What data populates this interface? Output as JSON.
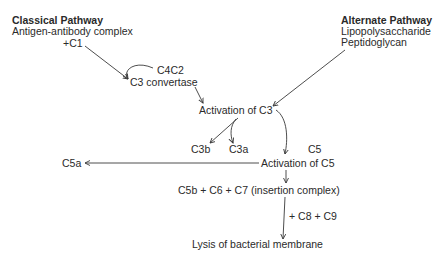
{
  "diagram": {
    "type": "complement-activation-pathway",
    "classical": {
      "title": "Classical Pathway",
      "trigger": "Antigen-antibody complex",
      "plus_c1": "+C1"
    },
    "alternate": {
      "title": "Alternate Pathway",
      "trigger1": "Lipopolysaccharide",
      "trigger2": "Peptidoglycan"
    },
    "nodes": {
      "c4c2": "C4C2",
      "c3_convertase": "C3 convertase",
      "activation_c3": "Activation of C3",
      "c3b": "C3b",
      "c3a": "C3a",
      "c5": "C5",
      "c5a": "C5a",
      "activation_c5": "Activation of C5",
      "insertion_complex": "C5b + C6 + C7 (insertion complex)",
      "plus_c8_c9": "+ C8 + C9",
      "lysis": "Lysis of bacterial membrane"
    },
    "edges": [
      {
        "from": "+C1",
        "to": "C3 convertase"
      },
      {
        "from": "C4C2",
        "to": "C3 convertase"
      },
      {
        "from": "C3 convertase",
        "to": "Activation of C3"
      },
      {
        "from": "Peptidoglycan",
        "to": "Activation of C3"
      },
      {
        "from": "Activation of C3",
        "to": "C3b"
      },
      {
        "from": "Activation of C3",
        "to": "C3a"
      },
      {
        "from": "Activation of C3",
        "to": "Activation of C5"
      },
      {
        "from": "Activation of C5",
        "to": "C5a"
      },
      {
        "from": "Activation of C5",
        "to": "C5b + C6 + C7 (insertion complex)"
      },
      {
        "from": "C5b + C6 + C7 (insertion complex)",
        "to": "Lysis of bacterial membrane"
      }
    ],
    "colors": {
      "text": "#2a2a2a",
      "line": "#3a3a3a",
      "background": "#ffffff"
    }
  }
}
